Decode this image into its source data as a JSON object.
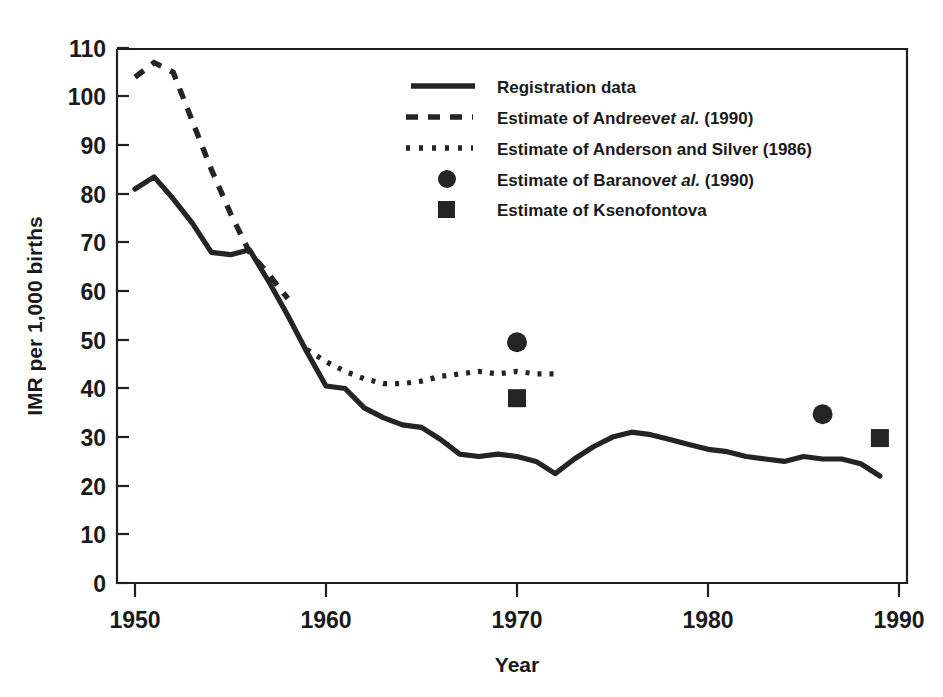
{
  "chart_data": {
    "type": "line",
    "title": "",
    "xlabel": "Year",
    "ylabel": "IMR per 1,000 births",
    "xlim": [
      1950,
      1990
    ],
    "ylim": [
      0,
      110
    ],
    "xticks": [
      1950,
      1960,
      1970,
      1980,
      1990
    ],
    "xtick_labels": [
      "1950",
      "1960",
      "1970",
      "1980",
      "1990"
    ],
    "yticks": [
      0,
      10,
      20,
      30,
      40,
      50,
      60,
      70,
      80,
      90,
      100,
      110
    ],
    "ytick_labels": [
      "0",
      "10",
      "20",
      "30",
      "40",
      "50",
      "60",
      "70",
      "80",
      "90",
      "100",
      "110"
    ],
    "grid": false,
    "legend_position": "upper-right",
    "series": [
      {
        "name": "Registration data",
        "style": "solid",
        "x": [
          1950,
          1951,
          1952,
          1953,
          1954,
          1955,
          1956,
          1957,
          1958,
          1959,
          1960,
          1961,
          1962,
          1963,
          1964,
          1965,
          1966,
          1967,
          1968,
          1969,
          1970,
          1971,
          1972,
          1973,
          1974,
          1975,
          1976,
          1977,
          1978,
          1979,
          1980,
          1981,
          1982,
          1983,
          1984,
          1985,
          1986,
          1987,
          1988,
          1989
        ],
        "values": [
          81.0,
          83.5,
          79.0,
          74.0,
          68.0,
          67.5,
          68.5,
          62.0,
          55.0,
          47.5,
          40.5,
          40.0,
          36.0,
          34.0,
          32.5,
          32.0,
          29.5,
          26.5,
          26.0,
          26.5,
          26.0,
          25.0,
          22.5,
          25.5,
          28.0,
          30.0,
          31.0,
          30.5,
          29.5,
          28.5,
          27.5,
          27.0,
          26.0,
          25.5,
          25.0,
          26.0,
          25.5,
          25.5,
          24.5,
          22.0
        ]
      },
      {
        "name": "Estimate of Andreev et al. (1990)",
        "style": "dashed",
        "x": [
          1950,
          1951,
          1952,
          1953,
          1954,
          1955,
          1956,
          1957,
          1958
        ],
        "values": [
          104.0,
          107.0,
          105.0,
          95.0,
          85.0,
          76.0,
          68.0,
          63.5,
          58.5
        ]
      },
      {
        "name": "Estimate of Anderson and Silver (1986)",
        "style": "dotted",
        "x": [
          1959,
          1960,
          1961,
          1962,
          1963,
          1964,
          1965,
          1966,
          1967,
          1968,
          1969,
          1970,
          1971,
          1972
        ],
        "values": [
          48.0,
          45.5,
          43.5,
          42.0,
          41.0,
          41.0,
          41.5,
          42.5,
          43.0,
          43.5,
          43.0,
          43.5,
          43.0,
          43.0
        ]
      },
      {
        "name": "Estimate of Baranov et al. (1990)",
        "style": "circle-marker",
        "x": [
          1970,
          1986
        ],
        "values": [
          49.5,
          34.7
        ]
      },
      {
        "name": "Estimate of Ksenofontova",
        "style": "square-marker",
        "x": [
          1970,
          1989
        ],
        "values": [
          38.0,
          29.8
        ]
      }
    ]
  },
  "legend": {
    "items": [
      {
        "marker": "solid-line",
        "text_before": "Registration data",
        "text_italic": "",
        "text_after": ""
      },
      {
        "marker": "dashed-line",
        "text_before": "Estimate of Andreev",
        "text_italic": "et al.",
        "text_after": " (1990)"
      },
      {
        "marker": "dotted-line",
        "text_before": "Estimate of Anderson and Silver (1986)",
        "text_italic": "",
        "text_after": ""
      },
      {
        "marker": "filled-circle",
        "text_before": "Estimate of Baranov",
        "text_italic": "et al.",
        "text_after": " (1990)"
      },
      {
        "marker": "filled-square",
        "text_before": "Estimate of Ksenofontova",
        "text_italic": "",
        "text_after": ""
      }
    ]
  },
  "colors": {
    "ink": "#242424",
    "frame": "#1f1f1f",
    "background": "#ffffff"
  }
}
